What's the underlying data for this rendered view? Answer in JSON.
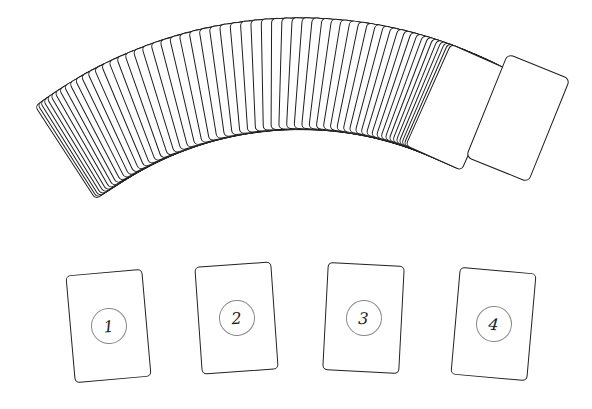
{
  "deck": {
    "card_count": 78,
    "arc_center": [
      300,
      500
    ],
    "start_angle": -33,
    "end_angle": 24
  },
  "drawn_card": {
    "face": "back"
  },
  "slots": [
    {
      "label": "1",
      "left": 70,
      "top": 272,
      "rotate": -5
    },
    {
      "label": "2",
      "left": 198,
      "top": 264,
      "rotate": -4
    },
    {
      "label": "3",
      "left": 325,
      "top": 264,
      "rotate": 3
    },
    {
      "label": "4",
      "left": 455,
      "top": 270,
      "rotate": 5
    }
  ],
  "colors": {
    "stroke": "#1e1e1e",
    "background": "#ffffff",
    "circle": "#888888"
  }
}
